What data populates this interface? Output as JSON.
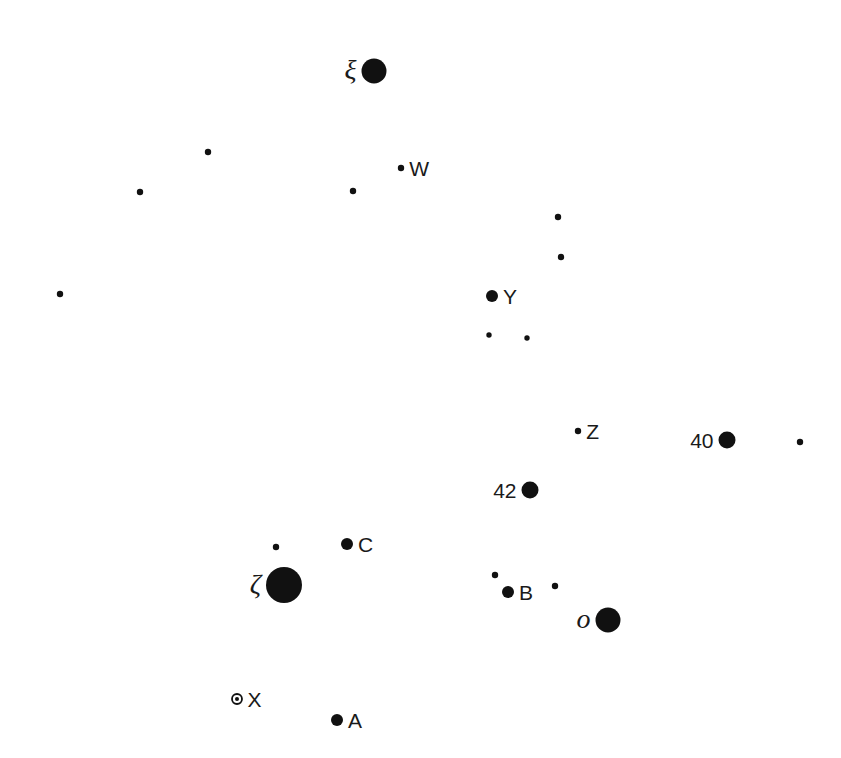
{
  "colors": {
    "star": "#111111",
    "label": "#1a1a1a",
    "background": "#ffffff"
  },
  "stars": [
    {
      "id": "xi",
      "label": "ξ",
      "magnitude_class": 1,
      "label_side": "left",
      "label_style": "greek",
      "x": 374,
      "y": 71
    },
    {
      "id": "W",
      "label": "W",
      "magnitude_class": 4,
      "label_side": "right",
      "label_style": "sans",
      "x": 401,
      "y": 168
    },
    {
      "id": "s1",
      "label": "",
      "magnitude_class": 4,
      "x": 208,
      "y": 152
    },
    {
      "id": "s2",
      "label": "",
      "magnitude_class": 4,
      "x": 140,
      "y": 192
    },
    {
      "id": "s3",
      "label": "",
      "magnitude_class": 4,
      "x": 353,
      "y": 191
    },
    {
      "id": "s4",
      "label": "",
      "magnitude_class": 4,
      "x": 558,
      "y": 217
    },
    {
      "id": "s5",
      "label": "",
      "magnitude_class": 4,
      "x": 561,
      "y": 257
    },
    {
      "id": "s6",
      "label": "",
      "magnitude_class": 4,
      "x": 60,
      "y": 294
    },
    {
      "id": "Y",
      "label": "Y",
      "magnitude_class": 3,
      "label_side": "right",
      "label_style": "sans",
      "x": 492,
      "y": 296
    },
    {
      "id": "s7",
      "label": "",
      "magnitude_class": 5,
      "x": 489,
      "y": 335
    },
    {
      "id": "s8",
      "label": "",
      "magnitude_class": 5,
      "x": 527,
      "y": 338
    },
    {
      "id": "Z",
      "label": "Z",
      "magnitude_class": 4,
      "label_side": "right",
      "label_style": "sans",
      "x": 578,
      "y": 431
    },
    {
      "id": "40",
      "label": "40",
      "magnitude_class": 2,
      "label_side": "left",
      "label_style": "sans",
      "x": 727,
      "y": 440
    },
    {
      "id": "s9",
      "label": "",
      "magnitude_class": 4,
      "x": 800,
      "y": 442
    },
    {
      "id": "42",
      "label": "42",
      "magnitude_class": 2,
      "label_side": "left",
      "label_style": "sans",
      "x": 530,
      "y": 490
    },
    {
      "id": "s10",
      "label": "",
      "magnitude_class": 4,
      "x": 276,
      "y": 547
    },
    {
      "id": "C",
      "label": "C",
      "magnitude_class": 3,
      "label_side": "right",
      "label_style": "sans",
      "x": 347,
      "y": 544
    },
    {
      "id": "zeta",
      "label": "ζ",
      "magnitude_class": 0,
      "label_side": "left",
      "label_style": "greek",
      "x": 284,
      "y": 585
    },
    {
      "id": "s11",
      "label": "",
      "magnitude_class": 4,
      "x": 495,
      "y": 575
    },
    {
      "id": "B",
      "label": "B",
      "magnitude_class": 3,
      "label_side": "right",
      "label_style": "sans",
      "x": 508,
      "y": 592
    },
    {
      "id": "s12",
      "label": "",
      "magnitude_class": 4,
      "x": 555,
      "y": 586
    },
    {
      "id": "omicron",
      "label": "o",
      "magnitude_class": 1,
      "label_side": "left",
      "label_style": "greek",
      "x": 608,
      "y": 620
    },
    {
      "id": "X",
      "label": "X",
      "magnitude_class": "variable",
      "label_side": "right",
      "label_style": "sans",
      "x": 237,
      "y": 699
    },
    {
      "id": "A",
      "label": "A",
      "magnitude_class": 3,
      "label_side": "right",
      "label_style": "sans",
      "x": 337,
      "y": 720
    }
  ]
}
